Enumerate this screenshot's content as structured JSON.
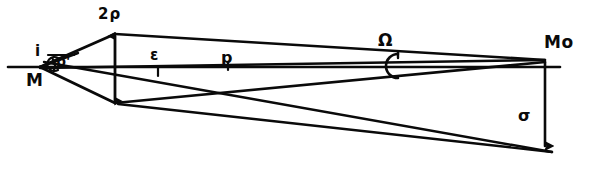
{
  "figure": {
    "background_color": "#ffffff",
    "stroke_color": "#0a0a0a",
    "width": 602,
    "height": 175
  },
  "labels": {
    "vertex_left": "M",
    "angle_incidence": "i",
    "angle_rho_prime": "ρ'",
    "span_two_rho": "2ρ",
    "segment_epsilon": "ε",
    "segment_p": "p",
    "angle_omega": "Ω",
    "vertex_right": "Mo",
    "segment_sigma": "σ"
  },
  "geometry": {
    "axis": {
      "x1": 8,
      "y1": 67,
      "x2": 560,
      "y2": 67
    },
    "vertex_M": {
      "x": 40,
      "y": 67
    },
    "vertex_Mo": {
      "x": 545,
      "y": 60
    },
    "rho_arrow": {
      "x": 115,
      "y_top": 33,
      "y_bottom": 103
    },
    "sigma_arrow": {
      "x": 545,
      "y_top": 62,
      "y_bottom": 150
    },
    "epsilon_tick": {
      "x": 158,
      "y": 67
    },
    "p_tick": {
      "x": 228,
      "y": 67
    },
    "crossing_point": {
      "x": 240,
      "y": 94
    }
  }
}
